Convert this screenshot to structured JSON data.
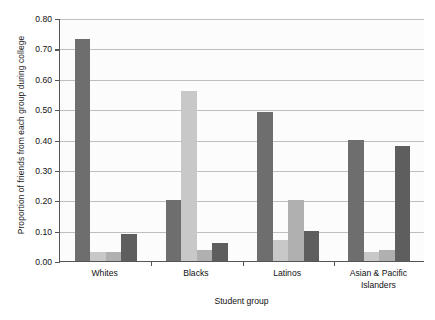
{
  "chart_data": {
    "type": "bar",
    "title": "",
    "subtitle": "",
    "xlabel": "Student group",
    "ylabel": "Proportion of friends from each group during college",
    "categories": [
      "Whites",
      "Blacks",
      "Latinos",
      "Asian & Pacific Islanders"
    ],
    "series": [
      {
        "name": "series-1",
        "color": "#6e6e6e",
        "values": [
          0.73,
          0.2,
          0.49,
          0.4
        ]
      },
      {
        "name": "series-2",
        "color": "#c8c8c8",
        "values": [
          0.03,
          0.56,
          0.07,
          0.03
        ]
      },
      {
        "name": "series-3",
        "color": "#b0b0b0",
        "values": [
          0.03,
          0.035,
          0.2,
          0.035
        ]
      },
      {
        "name": "series-4",
        "color": "#5e5e5e",
        "values": [
          0.09,
          0.06,
          0.1,
          0.38
        ]
      }
    ],
    "ylim": [
      0.0,
      0.8
    ],
    "ytick_labels": [
      "0.00",
      "0.10",
      "0.20",
      "0.30",
      "0.40",
      "0.50",
      "0.60",
      "0.70",
      "0.80"
    ],
    "ytick_values": [
      0.0,
      0.1,
      0.2,
      0.3,
      0.4,
      0.5,
      0.6,
      0.7,
      0.8
    ],
    "grid": true,
    "legend": false,
    "legend_position": "none",
    "axis_color": "#555555",
    "gridline_color": "#bfbfbf",
    "background_color": "#ffffff"
  },
  "x_tick_label_lines": [
    [
      "Whites"
    ],
    [
      "Blacks"
    ],
    [
      "Latinos"
    ],
    [
      "Asian & Pacific",
      "Islanders"
    ]
  ]
}
